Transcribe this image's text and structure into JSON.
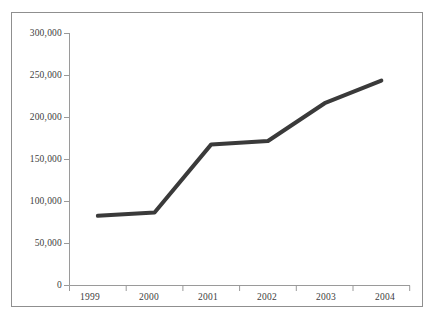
{
  "chart_data": {
    "type": "line",
    "title": "",
    "subtitle": "",
    "xlabel": "",
    "ylabel": "",
    "categories": [
      "1999",
      "2000",
      "2001",
      "2002",
      "2003",
      "2004"
    ],
    "values": [
      83000,
      87000,
      168000,
      172000,
      217000,
      244000
    ],
    "series": [
      {
        "name": "",
        "values": [
          83000,
          87000,
          168000,
          172000,
          217000,
          244000
        ],
        "color": "#3a3a3a"
      }
    ],
    "ylim": [
      0,
      300000
    ],
    "ytick_values": [
      0,
      50000,
      100000,
      150000,
      200000,
      250000,
      300000
    ],
    "ytick_labels": [
      "0",
      "50,000",
      "100,000",
      "150,000",
      "200,000",
      "250,000",
      "300,000"
    ],
    "xtick_labels": [
      "1999",
      "2000",
      "2001",
      "2002",
      "2003",
      "2004"
    ],
    "grid": false,
    "legend": null,
    "legend_position": "none",
    "annotations": [],
    "markers": false,
    "line_width": 4,
    "axis_color": "#9a9a9a",
    "frame_color": "#8f8f8f",
    "background_color": "#ffffff",
    "text_color": "#3d3d3d"
  }
}
